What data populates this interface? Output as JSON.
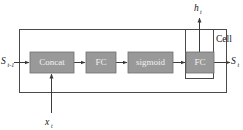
{
  "diagram": {
    "type": "block-diagram",
    "outer_box": {
      "name": "cell-outer-boundary"
    },
    "inner_box": {
      "name": "cell-inner-boundary",
      "label": "Cell"
    },
    "blocks": [
      {
        "id": "concat",
        "label": "Concat",
        "x": 30,
        "y": 52,
        "w": 44,
        "h": 21
      },
      {
        "id": "fc1",
        "label": "FC",
        "x": 86,
        "y": 52,
        "w": 30,
        "h": 21
      },
      {
        "id": "sigmoid",
        "label": "sigmoid",
        "x": 128,
        "y": 52,
        "w": 45,
        "h": 21
      },
      {
        "id": "fc2",
        "label": "FC",
        "x": 186,
        "y": 52,
        "w": 28,
        "h": 21
      }
    ],
    "io_labels": {
      "input_state": {
        "base": "S",
        "sub": "t-1"
      },
      "output_state": {
        "base": "S",
        "sub": "t"
      },
      "input_x": {
        "base": "x",
        "sub": "t"
      },
      "output_h": {
        "base": "h",
        "sub": "t"
      }
    },
    "colors": {
      "block_fill": "#999999",
      "block_text": "#f2f2f2",
      "line": "#3b3b3b",
      "background": "#ffffff"
    }
  }
}
